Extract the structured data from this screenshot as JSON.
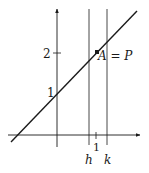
{
  "diagram": {
    "type": "line-graph",
    "y_ticks": [
      {
        "label": "1",
        "value": 1
      },
      {
        "label": "2",
        "value": 2
      }
    ],
    "x_ticks": [
      {
        "label": "1",
        "value": 1
      }
    ],
    "vertical_lines": [
      {
        "label": "h",
        "position": "left of 1"
      },
      {
        "label": "k",
        "position": "right of 1"
      }
    ],
    "line": {
      "description": "y = x + 1",
      "y_intercept": 1
    },
    "point": {
      "label": "A",
      "annotation": "= P",
      "full_label": "A = P"
    },
    "colors": {
      "ink": "#1a1a1a",
      "background": "#ffffff"
    }
  }
}
